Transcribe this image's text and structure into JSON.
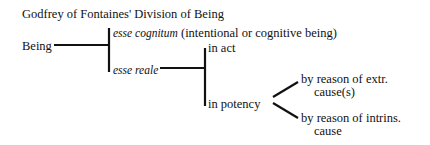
{
  "title": "Godfrey of Fontaines' Division of Being",
  "root": "Being",
  "level1": [
    {
      "label_italic": "esse cognitum",
      "label_rest": " (intentional or cognitive being)"
    },
    {
      "label_italic": "esse reale",
      "label_rest": ""
    }
  ],
  "level2": [
    {
      "label": "in act"
    },
    {
      "label": "in potency"
    }
  ],
  "level3": [
    {
      "line1": "by reason of extr.",
      "line2": "cause(s)"
    },
    {
      "line1": "by reason of intrins.",
      "line2": "cause"
    }
  ],
  "colors": {
    "line": "#111111",
    "background": "#ffffff"
  }
}
